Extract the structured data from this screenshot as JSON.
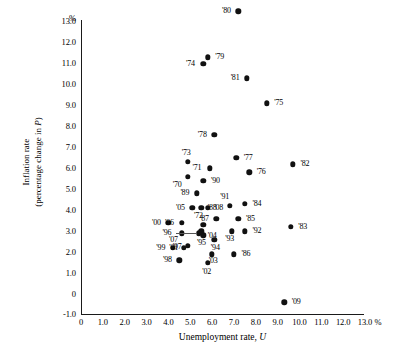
{
  "chart_data": {
    "type": "scatter",
    "title": "",
    "xlabel": "Unemployment rate, U",
    "ylabel": "Inflation rate (percentage change in P)",
    "ylabel_line1": "Inflation rate",
    "ylabel_line2": "(percentage change in P)",
    "ylabel_line2_prefix": "(percentage change in ",
    "ylabel_line2_italic": "P",
    "ylabel_line2_suffix": ")",
    "xlabel_text": "Unemployment rate, ",
    "xlabel_italic": "U",
    "x_unit": "%",
    "y_unit": "%",
    "xlim": [
      0,
      13.7
    ],
    "ylim": [
      -1.0,
      13.7
    ],
    "grid": false,
    "legend": false,
    "xticks": [
      "0",
      "1.0",
      "2.0",
      "3.0",
      "4.0",
      "5.0",
      "6.0",
      "7.0",
      "8.0",
      "9.0",
      "10.0",
      "11.0",
      "12.0",
      "13.0"
    ],
    "xtick_values": [
      0,
      1,
      2,
      3,
      4,
      5,
      6,
      7,
      8,
      9,
      10,
      11,
      12,
      13
    ],
    "yticks": [
      "13.0",
      "12.0",
      "11.0",
      "10.0",
      "9.0",
      "8.0",
      "7.0",
      "6.0",
      "5.0",
      "4.0",
      "3.0",
      "2.0",
      "1.0",
      "0",
      "-1.0"
    ],
    "ytick_values": [
      13,
      12,
      11,
      10,
      9,
      8,
      7,
      6,
      5,
      4,
      3,
      2,
      1,
      0,
      -1
    ],
    "points": [
      {
        "label": "'70",
        "x": 4.9,
        "y": 5.6,
        "lx": -11,
        "ly": 8
      },
      {
        "label": "'71",
        "x": 5.9,
        "y": 6.0,
        "lx": -13,
        "ly": 0
      },
      {
        "label": "'72",
        "x": 5.6,
        "y": 3.3,
        "lx": -5,
        "ly": -9
      },
      {
        "label": "'73",
        "x": 4.9,
        "y": 6.3,
        "lx": -2,
        "ly": -9
      },
      {
        "label": "'74",
        "x": 5.6,
        "y": 11.0,
        "lx": -13,
        "ly": 0
      },
      {
        "label": "'75",
        "x": 8.5,
        "y": 9.1,
        "lx": 12,
        "ly": 0
      },
      {
        "label": "'76",
        "x": 7.7,
        "y": 5.8,
        "lx": 12,
        "ly": 0
      },
      {
        "label": "'77",
        "x": 7.1,
        "y": 6.5,
        "lx": 12,
        "ly": 0
      },
      {
        "label": "'78",
        "x": 6.1,
        "y": 7.6,
        "lx": -12,
        "ly": 0
      },
      {
        "label": "'79",
        "x": 5.8,
        "y": 11.3,
        "lx": 12,
        "ly": 0
      },
      {
        "label": "'80",
        "x": 7.2,
        "y": 13.5,
        "lx": -12,
        "ly": 0
      },
      {
        "label": "'81",
        "x": 7.6,
        "y": 10.3,
        "lx": -12,
        "ly": 0
      },
      {
        "label": "'82",
        "x": 9.7,
        "y": 6.2,
        "lx": 12,
        "ly": 0
      },
      {
        "label": "'83",
        "x": 9.6,
        "y": 3.2,
        "lx": 12,
        "ly": 0
      },
      {
        "label": "'84",
        "x": 7.5,
        "y": 4.3,
        "lx": 12,
        "ly": 0
      },
      {
        "label": "'85",
        "x": 7.2,
        "y": 3.6,
        "lx": 12,
        "ly": 0
      },
      {
        "label": "'86",
        "x": 7.0,
        "y": 1.9,
        "lx": 12,
        "ly": 0
      },
      {
        "label": "'87",
        "x": 6.2,
        "y": 3.6,
        "lx": -12,
        "ly": 0
      },
      {
        "label": "'88",
        "x": 5.5,
        "y": 4.1,
        "lx": 11,
        "ly": 0
      },
      {
        "label": "'89",
        "x": 5.3,
        "y": 4.8,
        "lx": -12,
        "ly": 0
      },
      {
        "label": "'90",
        "x": 5.6,
        "y": 5.4,
        "lx": 12,
        "ly": 0
      },
      {
        "label": "'91",
        "x": 6.8,
        "y": 4.2,
        "lx": -5,
        "ly": -9
      },
      {
        "label": "'92",
        "x": 7.5,
        "y": 3.0,
        "lx": 12,
        "ly": 0
      },
      {
        "label": "'93",
        "x": 6.9,
        "y": 3.0,
        "lx": -2,
        "ly": 8
      },
      {
        "label": "'94",
        "x": 6.1,
        "y": 2.6,
        "lx": 1,
        "ly": 8
      },
      {
        "label": "'95",
        "x": 5.6,
        "y": 2.8,
        "lx": -2,
        "ly": 8
      },
      {
        "label": "'96",
        "x": 5.4,
        "y": 2.9,
        "lx": -32,
        "ly": 0
      },
      {
        "label": "'97",
        "x": 4.9,
        "y": 2.3,
        "lx": -11,
        "ly": 1
      },
      {
        "label": "'98",
        "x": 4.5,
        "y": 1.6,
        "lx": -12,
        "ly": 0
      },
      {
        "label": "'99",
        "x": 4.2,
        "y": 2.2,
        "lx": -12,
        "ly": 0
      },
      {
        "label": "'00",
        "x": 4.0,
        "y": 3.4,
        "lx": -12,
        "ly": 0
      },
      {
        "label": "'01",
        "x": 4.7,
        "y": 2.2,
        "lx": -10,
        "ly": 0
      },
      {
        "label": "'02",
        "x": 5.8,
        "y": 1.5,
        "lx": -1,
        "ly": 9
      },
      {
        "label": "'03",
        "x": 6.0,
        "y": 1.9,
        "lx": 1,
        "ly": 7
      },
      {
        "label": "'04",
        "x": 5.5,
        "y": 3.0,
        "lx": 11,
        "ly": 5
      },
      {
        "label": "'05",
        "x": 5.1,
        "y": 4.1,
        "lx": -12,
        "ly": 0
      },
      {
        "label": "'06",
        "x": 4.6,
        "y": 3.4,
        "lx": -12,
        "ly": 0
      },
      {
        "label": "'07",
        "x": 4.6,
        "y": 2.9,
        "lx": -8,
        "ly": 7
      },
      {
        "label": "'08",
        "x": 5.8,
        "y": 4.1,
        "lx": 11,
        "ly": 0
      },
      {
        "label": "'09",
        "x": 9.3,
        "y": -0.4,
        "lx": 12,
        "ly": 0
      }
    ],
    "leaders": [
      {
        "from_label": "'96",
        "to_x": 5.4,
        "to_y": 2.9
      }
    ]
  }
}
